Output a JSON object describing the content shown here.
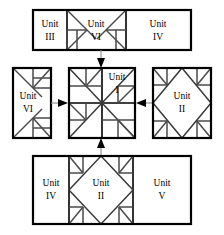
{
  "diagram": {
    "type": "quilt-block-assembly-flow",
    "blocks": [
      {
        "id": "top-bar",
        "position": "top",
        "cells": [
          {
            "label_line1": "Unit",
            "label_line2": "III",
            "pattern": "plain"
          },
          {
            "label_line1": "Unit",
            "label_line2": "VI",
            "pattern": "flying-geese-horizontal"
          },
          {
            "label_line1": "Unit",
            "label_line2": "IV",
            "pattern": "plain"
          }
        ]
      },
      {
        "id": "left-bar",
        "position": "left",
        "cells": [
          {
            "label_line1": "Unit",
            "label_line2": "VI",
            "pattern": "flying-geese-vertical"
          }
        ]
      },
      {
        "id": "center",
        "position": "center",
        "cells": [
          {
            "label_line1": "Unit",
            "label_line2": "I",
            "pattern": "pinwheel-star"
          }
        ]
      },
      {
        "id": "right-bar",
        "position": "right",
        "cells": [
          {
            "label_line1": "Unit",
            "label_line2": "II",
            "pattern": "square-in-square"
          }
        ]
      },
      {
        "id": "bottom-bar",
        "position": "bottom",
        "cells": [
          {
            "label_line1": "Unit",
            "label_line2": "IV",
            "pattern": "plain"
          },
          {
            "label_line1": "Unit",
            "label_line2": "II",
            "pattern": "square-in-square"
          },
          {
            "label_line1": "Unit",
            "label_line2": "V",
            "pattern": "plain"
          }
        ]
      }
    ],
    "arrows": [
      {
        "name": "arrow-top-to-center",
        "direction": "down"
      },
      {
        "name": "arrow-left-to-center",
        "direction": "right"
      },
      {
        "name": "arrow-right-to-center",
        "direction": "left"
      },
      {
        "name": "arrow-bottom-to-center",
        "direction": "up"
      }
    ],
    "colors": {
      "background": "#ffffff",
      "block_border": "#000000",
      "piece_line": "#4a4a4a",
      "arrow": "#000000"
    }
  }
}
